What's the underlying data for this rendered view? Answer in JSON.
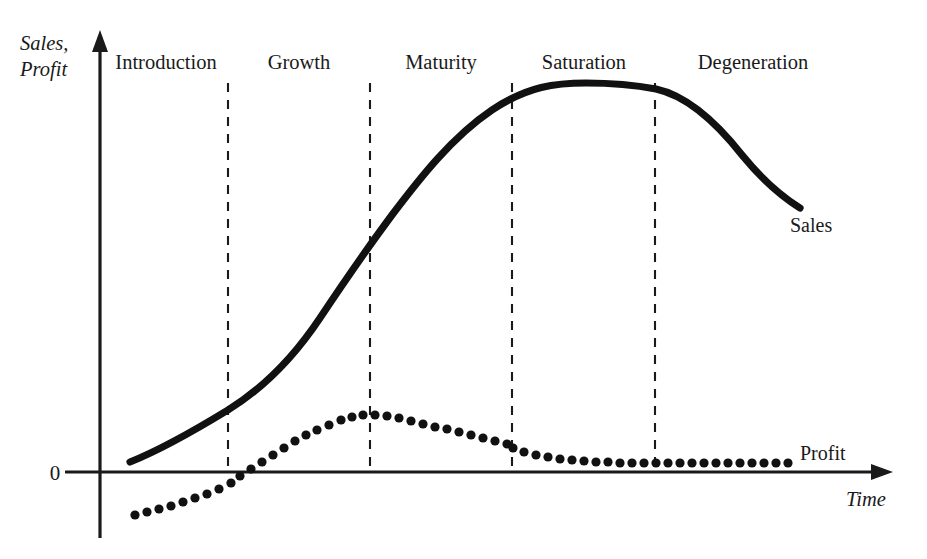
{
  "figure": {
    "background_color": "#ffffff",
    "ink_color": "#111111"
  },
  "axes": {
    "y_caption_line1": "Sales,",
    "y_caption_line2": "Profit",
    "x_caption": "Time",
    "origin_label": "0",
    "origin_px": {
      "x": 100,
      "y": 472
    },
    "y_axis_top_px": 35,
    "y_axis_bottom_px": 538,
    "x_axis_right_px": 890
  },
  "series_labels": {
    "sales": "Sales",
    "profit": "Profit"
  },
  "chart_data": {
    "type": "line",
    "xlabel": "Time",
    "ylabel": "Sales, Profit",
    "grid": false,
    "legend": "inline-end-of-line",
    "xlim": [
      0,
      100
    ],
    "ylim": [
      -12,
      100
    ],
    "stages": [
      {
        "name": "Introduction",
        "start": 0,
        "end": 18,
        "label_x": 9.5
      },
      {
        "name": "Growth",
        "start": 18,
        "end": 36,
        "label_x": 27.5
      },
      {
        "name": "Maturity",
        "start": 36,
        "end": 54,
        "label_x": 45.0
      },
      {
        "name": "Saturation",
        "start": 54,
        "end": 72,
        "label_x": 63.0
      },
      {
        "name": "Degeneration",
        "start": 72,
        "end": 100,
        "label_x": 84.0
      }
    ],
    "stage_boundaries": [
      18,
      36,
      54,
      72
    ],
    "series": [
      {
        "name": "Sales",
        "style": "solid-thick",
        "x": [
          4,
          10,
          18,
          24,
          30,
          36,
          42,
          48,
          54,
          60,
          63,
          66,
          72,
          78,
          84,
          89
        ],
        "values": [
          2,
          8,
          16,
          25,
          38,
          55,
          70,
          82,
          90,
          95,
          96,
          95.5,
          94,
          88,
          76,
          61
        ]
      },
      {
        "name": "Profit",
        "style": "dotted",
        "x": [
          4,
          8,
          12,
          16,
          18,
          22,
          26,
          30,
          34,
          36,
          40,
          44,
          48,
          52,
          54,
          58,
          62,
          66,
          70,
          72,
          76,
          82,
          88,
          92
        ],
        "values": [
          -11,
          -8.5,
          -6,
          -3,
          -1.5,
          4,
          9,
          13,
          14.5,
          14,
          12.5,
          11,
          9.5,
          8,
          7.5,
          5.5,
          4,
          3,
          2.2,
          2,
          1.7,
          1.5,
          1.4,
          1.4
        ]
      }
    ]
  },
  "geometry": {
    "stage_label_y": 62,
    "divider_top_y": 83,
    "divider_bottom_y": 472,
    "divider_x": [
      228,
      370,
      512,
      655
    ],
    "sales_path": "M 130,462 C 160,450 192,432 228,410 C 262,389 292,360 320,318 C 348,276 366,250 392,215 C 420,178 452,137 492,110 C 528,86 556,83 586,83 C 616,83 640,86 656,89 C 688,96 716,122 742,155 C 764,182 784,198 800,208",
    "sales_label_px": {
      "x": 790,
      "y": 232
    },
    "profit_label_px": {
      "x": 800,
      "y": 460
    },
    "time_label_px": {
      "x": 846,
      "y": 506
    },
    "origin_label_px": {
      "x": 55,
      "y": 480
    },
    "y_caption_px": {
      "x": 20,
      "y": 50
    },
    "profit_dot_radius": 4.6,
    "profit_dots": [
      [
        135,
        515
      ],
      [
        147,
        512
      ],
      [
        159,
        509
      ],
      [
        171,
        506
      ],
      [
        183,
        502
      ],
      [
        195,
        498
      ],
      [
        207,
        494
      ],
      [
        219,
        489
      ],
      [
        231,
        483
      ],
      [
        240,
        476
      ],
      [
        251,
        469
      ],
      [
        262,
        462
      ],
      [
        273,
        455
      ],
      [
        284,
        448
      ],
      [
        295,
        441
      ],
      [
        306,
        435
      ],
      [
        317,
        430
      ],
      [
        329,
        425
      ],
      [
        341,
        420
      ],
      [
        352,
        417
      ],
      [
        363,
        415
      ],
      [
        375,
        415
      ],
      [
        387,
        416
      ],
      [
        399,
        418
      ],
      [
        411,
        421
      ],
      [
        423,
        424
      ],
      [
        435,
        427
      ],
      [
        447,
        429
      ],
      [
        459,
        432
      ],
      [
        471,
        435
      ],
      [
        483,
        438
      ],
      [
        495,
        441
      ],
      [
        507,
        444
      ],
      [
        513,
        448
      ],
      [
        524,
        452
      ],
      [
        536,
        455
      ],
      [
        548,
        457
      ],
      [
        560,
        459
      ],
      [
        572,
        460
      ],
      [
        584,
        461
      ],
      [
        596,
        462
      ],
      [
        608,
        462
      ],
      [
        620,
        463
      ],
      [
        632,
        463
      ],
      [
        644,
        463
      ],
      [
        656,
        463
      ],
      [
        668,
        463
      ],
      [
        680,
        463
      ],
      [
        692,
        463
      ],
      [
        704,
        463
      ],
      [
        716,
        463
      ],
      [
        728,
        463
      ],
      [
        740,
        463
      ],
      [
        752,
        463
      ],
      [
        764,
        463
      ],
      [
        776,
        463
      ],
      [
        788,
        463
      ]
    ]
  }
}
